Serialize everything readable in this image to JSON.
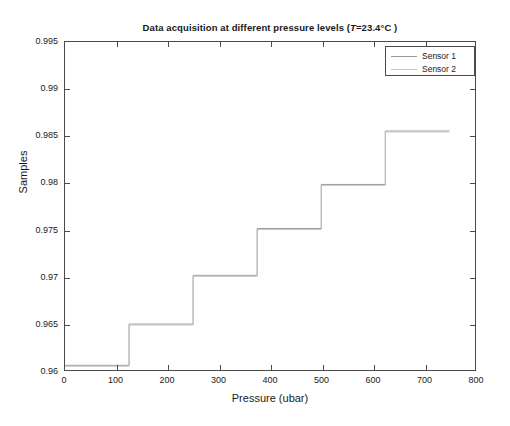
{
  "chart_data": {
    "type": "line",
    "title_plain": "Data acquisition at different pressure levels",
    "title_italic_part": "T",
    "title_tail": "=23.4°C )",
    "xlabel": "Pressure (ubar)",
    "ylabel": "Samples",
    "xlim": [
      0,
      800
    ],
    "ylim": [
      0.96,
      0.995
    ],
    "xticks": [
      0,
      100,
      200,
      300,
      400,
      500,
      600,
      700,
      800
    ],
    "xtick_labels": [
      "0",
      "100",
      "200",
      "300",
      "400",
      "500",
      "600",
      "700",
      "800"
    ],
    "yticks": [
      0.96,
      0.965,
      0.97,
      0.975,
      0.98,
      0.985,
      0.99,
      0.995
    ],
    "ytick_labels": [
      "0.96",
      "0.965",
      "0.97",
      "0.975",
      "0.98",
      "0.985",
      "0.99",
      "0.995"
    ],
    "grid": false,
    "legend_position": "upper right",
    "step_shape": "post",
    "series": [
      {
        "name": "Sensor 1",
        "color": "#9a9a9a",
        "x": [
          0,
          125,
          125,
          250,
          250,
          375,
          375,
          500,
          500,
          625,
          625,
          750
        ],
        "y": [
          0.9605,
          0.9605,
          0.9649,
          0.9649,
          0.9701,
          0.9701,
          0.9751,
          0.9751,
          0.9798,
          0.9798,
          0.9855,
          0.9855
        ]
      },
      {
        "name": "Sensor 2",
        "color": "#c4c4c4",
        "x": [
          0,
          125,
          125,
          250,
          250,
          375,
          375,
          500,
          500,
          625,
          625,
          750
        ],
        "y": [
          0.9604,
          0.9604,
          0.9648,
          0.9648,
          0.97,
          0.97,
          0.975,
          0.975,
          0.9797,
          0.9797,
          0.9854,
          0.9854
        ]
      }
    ],
    "step_levels": [
      0.9605,
      0.9649,
      0.9701,
      0.9751,
      0.9798,
      0.9855
    ],
    "step_edges_ubar": [
      125,
      250,
      375,
      500,
      625
    ]
  },
  "legend": {
    "entries": [
      {
        "label": "Sensor 1",
        "color": "#9a9a9a"
      },
      {
        "label": "Sensor 2",
        "color": "#c4c4c4"
      }
    ]
  },
  "axes": {
    "frame_color": "#4a4a4a"
  }
}
